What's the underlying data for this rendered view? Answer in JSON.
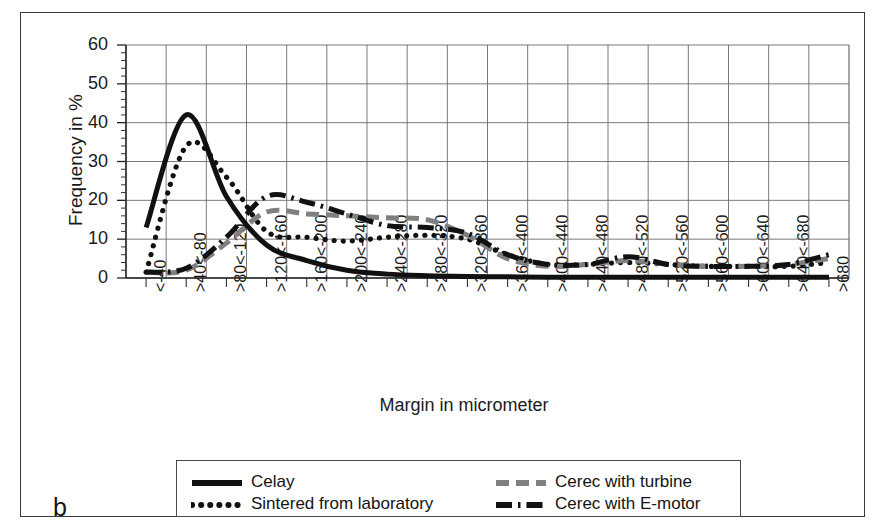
{
  "figure": {
    "panel_label": "b",
    "x_axis_title": "Margin in micrometer",
    "y_axis_title": "Frequency in %"
  },
  "legend": {
    "entries": [
      {
        "label": "Celay",
        "style": "solid",
        "color": "#111111"
      },
      {
        "label": "Sintered from laboratory",
        "style": "dotted",
        "color": "#111111"
      },
      {
        "label": "Cerec with turbine",
        "style": "dashed",
        "color": "#808080"
      },
      {
        "label": "Cerec with E-motor",
        "style": "dashdot",
        "color": "#111111"
      }
    ]
  },
  "chart_data": {
    "type": "line",
    "title": "",
    "xlabel": "Margin in micrometer",
    "ylabel": "Frequency in %",
    "ylim": [
      0,
      60
    ],
    "yticks": [
      0,
      10,
      20,
      30,
      40,
      50,
      60
    ],
    "ytick_minor_step": 2,
    "grid": true,
    "legend_position": "bottom",
    "categories": [
      "<-40",
      ">40<-80",
      ">80<-120",
      ">120<-160",
      ">160<-200",
      ">200<-240",
      ">240<-280",
      ">280<-320",
      ">320<-360",
      ">360<-400",
      ">400<-440",
      ">440<-480",
      ">480<-520",
      ">520<-560",
      ">560<-600",
      ">600<-640",
      ">640<-680",
      ">680"
    ],
    "series": [
      {
        "name": "Celay",
        "style": "solid",
        "color": "#111111",
        "values": [
          13,
          42,
          21,
          8.5,
          4.5,
          2,
          1,
          0.6,
          0.4,
          0.3,
          0.2,
          0.2,
          0.2,
          0.2,
          0.2,
          0.2,
          0.2,
          0.2
        ]
      },
      {
        "name": "Sintered from laboratory",
        "style": "dotted",
        "color": "#111111",
        "values": [
          1.5,
          34,
          26,
          12,
          10.5,
          9.5,
          10.5,
          11,
          10,
          6,
          3.5,
          3.5,
          4,
          3.5,
          3,
          3,
          3,
          4
        ]
      },
      {
        "name": "Cerec with turbine",
        "style": "dashed",
        "color": "#808080",
        "values": [
          1.5,
          2,
          9,
          17,
          16.5,
          16,
          15.5,
          15,
          11,
          5,
          3,
          3.5,
          4.5,
          3.5,
          3,
          3,
          3.5,
          5
        ]
      },
      {
        "name": "Cerec with E-motor",
        "style": "dashdot",
        "color": "#111111",
        "values": [
          1.5,
          2.5,
          10.5,
          21,
          19.5,
          16.5,
          13.5,
          13,
          11.5,
          6,
          3.5,
          3.5,
          5.5,
          3.5,
          3,
          3,
          3.5,
          6
        ]
      }
    ]
  }
}
